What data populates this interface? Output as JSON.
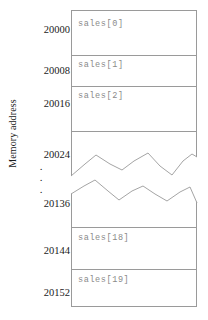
{
  "diagram": {
    "title": "",
    "axis_title": "Memory address",
    "colors": {
      "border": "#9a9a9a",
      "cell_text": "#8a8a8a",
      "label_text": "#1a1a1a",
      "background": "#ffffff",
      "squiggle": "#9a9a9a"
    },
    "address_labels": [
      {
        "text": "20000",
        "y": 25
      },
      {
        "text": "20008",
        "y": 66
      },
      {
        "text": "20016",
        "y": 99
      },
      {
        "text": "20024",
        "y": 150
      },
      {
        "text": "20136",
        "y": 199
      },
      {
        "text": "20144",
        "y": 246
      },
      {
        "text": "20152",
        "y": 288
      }
    ],
    "ellipsis_dots": [
      {
        "text": ".",
        "y": 163
      },
      {
        "text": ".",
        "y": 174
      },
      {
        "text": ".",
        "y": 186
      }
    ],
    "cells": [
      {
        "name": "sales[0]",
        "label": "sales[0]",
        "label_y": 19,
        "divider_y": 44
      },
      {
        "name": "sales[1]",
        "label": "sales[1]",
        "label_y": 60,
        "divider_y": 75
      },
      {
        "name": "sales[2]",
        "label": "sales[2]",
        "label_y": 91,
        "divider_y": 120
      },
      {
        "name": "gap-upper",
        "label": "",
        "label_y": 0,
        "divider_y": 216
      },
      {
        "name": "sales[18]",
        "label": "sales[18]",
        "label_y": 233,
        "divider_y": 258
      },
      {
        "name": "sales[19]",
        "label": "sales[19]",
        "label_y": 275,
        "divider_y": -1
      }
    ],
    "break_lines": {
      "upper_points": "71,176 85,164 96,155 110,164 122,170 134,161 148,153 160,166 172,175 183,161 192,154 197,157",
      "lower_points": "71,194 84,186 95,180 108,191 119,200 132,191 143,186 155,194 167,201 180,192 190,187 197,203"
    }
  }
}
